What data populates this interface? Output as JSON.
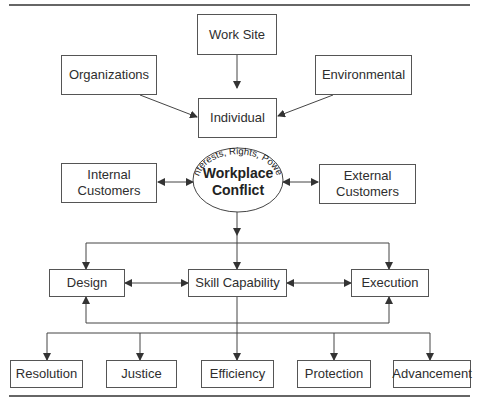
{
  "diagram": {
    "colors": {
      "line": "#444444",
      "box_border": "#555555",
      "text": "#2e2e2e",
      "background": "#ffffff"
    },
    "top_level": {
      "work_site": "Work Site",
      "organizations": "Organizations",
      "environmental": "Environmental",
      "individual": "Individual"
    },
    "conflict": {
      "arc_text": "Interests, Rights, Power",
      "title_line1": "Workplace",
      "title_line2": "Conflict"
    },
    "customers": {
      "internal_line1": "Internal",
      "internal_line2": "Customers",
      "external_line1": "External",
      "external_line2": "Customers"
    },
    "process": {
      "design": "Design",
      "skill_capability": "Skill Capability",
      "execution": "Execution"
    },
    "outcomes": [
      {
        "label": "Resolution"
      },
      {
        "label": "Justice"
      },
      {
        "label": "Efficiency"
      },
      {
        "label": "Protection"
      },
      {
        "label": "Advancement"
      }
    ]
  }
}
